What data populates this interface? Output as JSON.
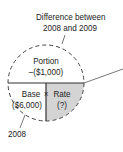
{
  "diagram": {
    "callouts": {
      "top_line1": "Difference between",
      "top_line2": "2008 and 2009",
      "bottom": "2008"
    },
    "sections": {
      "portion_label": "Portion",
      "portion_value": "–($1,000)",
      "base_label": "Base",
      "base_value": "($6,000)",
      "operator": "×",
      "rate_label": "Rate",
      "rate_value": "(?)"
    },
    "colors": {
      "rate_fill": "#d4d4d4",
      "lines": "#333333",
      "text": "#222222"
    }
  }
}
